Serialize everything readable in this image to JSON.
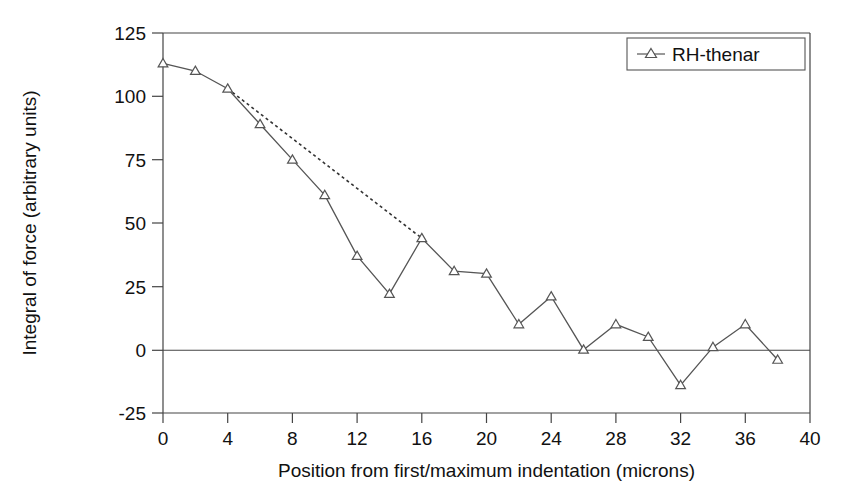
{
  "chart_data": {
    "type": "line",
    "title": "",
    "xlabel": "Position from first/maximum indentation (microns)",
    "ylabel": "Integral of force (arbitrary units)",
    "xlim": [
      0,
      40
    ],
    "ylim": [
      -25,
      125
    ],
    "xticks": [
      0,
      4,
      8,
      12,
      16,
      20,
      24,
      28,
      32,
      36,
      40
    ],
    "yticks": [
      -25,
      0,
      25,
      50,
      75,
      100,
      125
    ],
    "xtick_labels": [
      "0",
      "4",
      "8",
      "12",
      "16",
      "20",
      "24",
      "28",
      "32",
      "36",
      "40"
    ],
    "ytick_labels": [
      "-25",
      "0",
      "25",
      "50",
      "75",
      "100",
      "125"
    ],
    "grid": false,
    "legend_position": "top-right",
    "marker": "triangle-open",
    "line_color": "#555555",
    "marker_color": "#555555",
    "zero_line": 0,
    "series": [
      {
        "name": "RH-thenar",
        "x": [
          0,
          2,
          4,
          6,
          8,
          10,
          12,
          14,
          16,
          18,
          20,
          22,
          24,
          26,
          28,
          30,
          32,
          34,
          36,
          38
        ],
        "values": [
          113,
          110,
          103,
          89,
          75,
          61,
          37,
          22,
          44,
          31,
          30,
          10,
          21,
          0,
          10,
          5,
          -14,
          1,
          10,
          -4
        ]
      }
    ],
    "trend_line": {
      "style": "dotted",
      "x": [
        4,
        16
      ],
      "values": [
        103,
        44
      ]
    },
    "annotations": []
  },
  "legend": {
    "entries": [
      {
        "label": "RH-thenar",
        "marker": "triangle-open"
      }
    ]
  },
  "axes": {
    "x_title": "Position from first/maximum indentation (microns)",
    "y_title": "Integral of force (arbitrary units)"
  }
}
